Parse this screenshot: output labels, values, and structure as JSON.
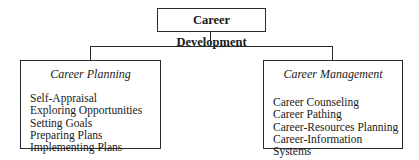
{
  "root": {
    "label": "Career Development"
  },
  "branches": [
    {
      "title": "Career Planning",
      "items": [
        "Self-Appraisal",
        "Exploring Opportunities",
        "Setting Goals",
        "Preparing Plans",
        "Implementing Plans"
      ]
    },
    {
      "title": "Career Management",
      "items": [
        "Career Counseling",
        "Career Pathing",
        "Career-Resources Planning",
        "Career-Information Systems"
      ]
    }
  ]
}
